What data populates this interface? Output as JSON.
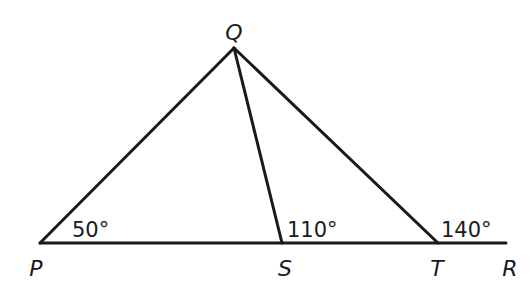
{
  "diagram": {
    "type": "geometry-triangle",
    "points": {
      "P": {
        "label": "P",
        "x": 40,
        "y": 243
      },
      "Q": {
        "label": "Q",
        "x": 234,
        "y": 48
      },
      "S": {
        "label": "S",
        "x": 282,
        "y": 243
      },
      "T": {
        "label": "T",
        "x": 438,
        "y": 243
      },
      "R": {
        "label": "R",
        "x": 506,
        "y": 243
      }
    },
    "segments": [
      {
        "from": "P",
        "to": "Q"
      },
      {
        "from": "Q",
        "to": "S"
      },
      {
        "from": "Q",
        "to": "T"
      },
      {
        "from": "P",
        "to": "R"
      }
    ],
    "angles": {
      "at_P": {
        "label": "50°",
        "vertex": "P"
      },
      "at_S": {
        "label": "110°",
        "vertex": "S"
      },
      "at_T": {
        "label": "140°",
        "vertex": "T"
      }
    }
  }
}
